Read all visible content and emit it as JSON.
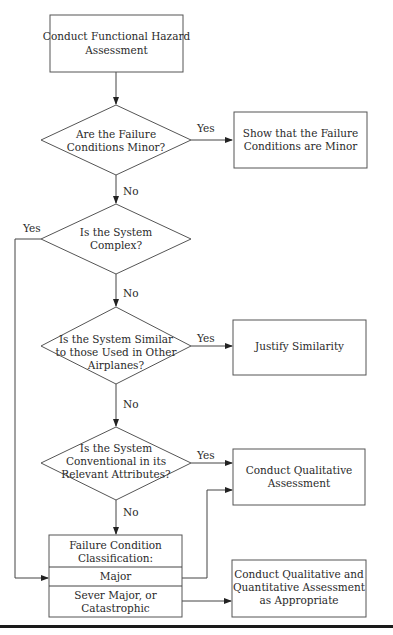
{
  "diagram": {
    "type": "flowchart",
    "nodes": {
      "start": {
        "shape": "box",
        "lines": [
          "Conduct Functional Hazard",
          "Assessment"
        ]
      },
      "q_minor": {
        "shape": "diamond",
        "lines": [
          "Are the Failure",
          "Conditions Minor?"
        ]
      },
      "show_minor": {
        "shape": "box",
        "lines": [
          "Show that the Failure",
          "Conditions are Minor"
        ]
      },
      "q_complex": {
        "shape": "diamond",
        "lines": [
          "Is the System",
          "Complex?"
        ]
      },
      "q_similar": {
        "shape": "diamond",
        "lines": [
          "Is the System Similar",
          "to those Used in Other",
          "Airplanes?"
        ]
      },
      "justify": {
        "shape": "box",
        "lines": [
          "Justify Similarity"
        ]
      },
      "q_conventional": {
        "shape": "diamond",
        "lines": [
          "Is the System",
          "Conventional in its",
          "Relevant Attributes?"
        ]
      },
      "qualitative": {
        "shape": "box",
        "lines": [
          "Conduct Qualitative",
          "Assessment"
        ]
      },
      "classification": {
        "shape": "table",
        "header": [
          "Failure Condition",
          "Classification:"
        ],
        "rows": [
          {
            "lines": [
              "Major"
            ]
          },
          {
            "lines": [
              "Sever Major, or",
              "Catastrophic"
            ]
          }
        ]
      },
      "quantitative": {
        "shape": "box",
        "lines": [
          "Conduct Qualitative and",
          "Quantitative Assessment",
          "as Appropriate"
        ]
      }
    },
    "edges": [
      {
        "from": "start",
        "to": "q_minor",
        "label": ""
      },
      {
        "from": "q_minor",
        "to": "show_minor",
        "label": "Yes"
      },
      {
        "from": "q_minor",
        "to": "q_complex",
        "label": "No"
      },
      {
        "from": "q_complex",
        "to": "classification",
        "label": "Yes"
      },
      {
        "from": "q_complex",
        "to": "q_similar",
        "label": "No"
      },
      {
        "from": "q_similar",
        "to": "justify",
        "label": "Yes"
      },
      {
        "from": "q_similar",
        "to": "q_conventional",
        "label": "No"
      },
      {
        "from": "q_conventional",
        "to": "qualitative",
        "label": "Yes"
      },
      {
        "from": "q_conventional",
        "to": "classification",
        "label": "No"
      },
      {
        "from": "classification.Major",
        "to": "qualitative",
        "label": ""
      },
      {
        "from": "classification.Sever Major, or Catastrophic",
        "to": "quantitative",
        "label": ""
      }
    ]
  }
}
